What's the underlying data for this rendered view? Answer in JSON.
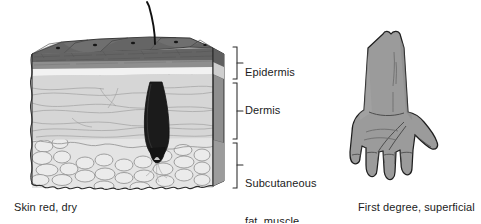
{
  "figure": {
    "width": 481,
    "height": 223,
    "background": "#ffffff"
  },
  "skin_block": {
    "name": "skin-cross-section-block",
    "layers": [
      {
        "id": "epidermis",
        "label": "Epidermis",
        "description": "Dark gray keratinized surface with polygonal cells and melanin dots, medium gray stratum, pale basal band",
        "colors": {
          "top_face": "#6f6f6f",
          "surface_cells": "#5d5d5d",
          "stratum": "#8e8e8e",
          "pale_band": "#f2f2f2"
        }
      },
      {
        "id": "dermis",
        "label": "Dermis",
        "description": "Light gray matrix with wavy collagen fiber lines and rete ridge junction",
        "colors": {
          "fill": "#d6d6d6",
          "fibers": "#9a9a9a",
          "junction_line": "#6e6e6e"
        }
      },
      {
        "id": "subcutaneous",
        "label": "Subcutaneous\nfat, muscle",
        "description": "Lobular bubbly fat cells",
        "colors": {
          "fill": "#e4e4e4",
          "cell_outline": "#8c8c8c"
        }
      }
    ],
    "hair": {
      "name": "hair-shaft-and-follicle",
      "color": "#111111",
      "description": "Dark hair shaft emerging through epidermis into a deep follicle bulb in the dermis"
    },
    "side_face_color": "#848484",
    "outline_color": "#2b2b2b"
  },
  "brackets": [
    {
      "id": "bracket-epidermis",
      "top": 47,
      "bottom": 79,
      "label": "Epidermis"
    },
    {
      "id": "bracket-dermis",
      "top": 83,
      "bottom": 139,
      "label": "Dermis"
    },
    {
      "id": "bracket-subcutaneous",
      "top": 143,
      "bottom": 188,
      "label": "Subcutaneous fat, muscle"
    }
  ],
  "labels": {
    "epidermis": "Epidermis",
    "dermis": "Dermis",
    "subcutaneous_line1": "Subcutaneous",
    "subcutaneous_line2": "fat, muscle"
  },
  "arm": {
    "name": "forearm-and-hand-diagram",
    "view": "palmar",
    "fill_color": "#9b9b9b",
    "outline_color": "#1f1f1f",
    "crease_color": "#6a6a6a",
    "description": "Uniformly reddened forearm and hand indicating a first degree superficial burn"
  },
  "captions": {
    "left": "Skin red, dry",
    "right": "First degree, superficial"
  },
  "colors": {
    "text": "#1b1b1b",
    "bracket": "#2b2b2b",
    "background": "#ffffff"
  }
}
